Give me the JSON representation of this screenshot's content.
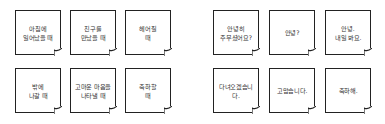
{
  "situations": [
    {
      "text": "아침에\n일어났을 때"
    },
    {
      "text": "친구를\n만났을 때"
    },
    {
      "text": "헤어질\n때"
    },
    {
      "text": "밖에\n나갈 때"
    },
    {
      "text": "고마운 마음을\n나타낼 때"
    },
    {
      "text": "축하할\n때"
    }
  ],
  "greetings": [
    {
      "text": "안녕히\n주무셨어요?"
    },
    {
      "text": "안녕?"
    },
    {
      "text": "안녕.\n내일 봐요."
    },
    {
      "text": "다녀오겠습니다."
    },
    {
      "text": "고맙습니다."
    },
    {
      "text": "축하해."
    }
  ],
  "colors": {
    "border": "#222222",
    "background": "#ffffff",
    "text": "#333333"
  }
}
